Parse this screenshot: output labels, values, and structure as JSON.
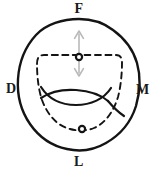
{
  "figure": {
    "type": "anatomical-line-diagram",
    "canvas": {
      "width": 158,
      "height": 173
    },
    "background_color": "#ffffff",
    "outline_color": "#141414",
    "dashed_color": "#141414",
    "arrow_color": "#b9b9b9",
    "marker_fill": "#ffffff",
    "marker_stroke": "#141414"
  },
  "labels": {
    "facial": "F",
    "distal": "D",
    "mesial": "M",
    "lingual": "L"
  },
  "label_positions": {
    "facial": {
      "x": 79,
      "y": 9
    },
    "distal": {
      "x": 12,
      "y": 89
    },
    "mesial": {
      "x": 142,
      "y": 90
    },
    "lingual": {
      "x": 79,
      "y": 162
    }
  },
  "markers": [
    {
      "name": "upper-center-point",
      "x": 79,
      "y": 57,
      "radius": 3.1
    },
    {
      "name": "lower-center-point",
      "x": 82,
      "y": 129,
      "radius": 3.1
    }
  ],
  "arrow": {
    "name": "vertical-double-arrow",
    "x": 79,
    "y_top": 31,
    "y_bottom": 76,
    "color": "#b9b9b9",
    "double_headed": true
  },
  "geometry": {
    "outer_outline": "M 79 19 C 92 19 104 23 113 30 C 124 38 133 49 137 63 C 141 77 140 92 136 106 C 131 122 120 135 106 143 C 94 150 80 152 67 149 C 52 146 39 137 30 124 C 21 111 17 95 18 79 C 19 63 25 47 36 35 C 46 24 63 19 79 19 Z",
    "dashed_contour": "M 79 55 C 62 55 50 55 44 55 C 39 55 37 58 37 64 C 37 74 38 88 42 100 C 47 114 57 126 70 129 C 77 131 87 131 94 128 C 106 123 114 110 118 97 C 121 86 122 72 122 63 C 122 57 120 55 115 55 C 106 55 95 55 79 55 Z",
    "fossa_upper": "M 41 87 C 48 98 60 105 76 105 C 91 105 104 99 111 88",
    "fossa_lower": "M 41 98 C 50 92 62 89 76 90 C 90 91 101 95 108 101",
    "groove_tail": "M 108 101 C 113 107 118 112 124 116"
  }
}
